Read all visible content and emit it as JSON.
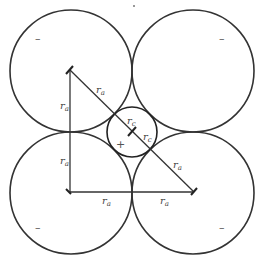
{
  "diagram": {
    "title": "",
    "stroke_color": "#333333",
    "large_circles": [
      {
        "id": "top-left",
        "cx": 71,
        "cy": 71,
        "r": 61,
        "sign": "–",
        "sign_x": 38,
        "sign_y": 41
      },
      {
        "id": "top-right",
        "cx": 193,
        "cy": 71,
        "r": 61,
        "sign": "–",
        "sign_x": 223,
        "sign_y": 41
      },
      {
        "id": "bottom-left",
        "cx": 71,
        "cy": 193,
        "r": 61,
        "sign": "–",
        "sign_x": 38,
        "sign_y": 230
      },
      {
        "id": "bottom-right",
        "cx": 193,
        "cy": 193,
        "r": 61,
        "sign": "–",
        "sign_x": 223,
        "sign_y": 230
      }
    ],
    "small_circle": {
      "id": "center",
      "cx": 132,
      "cy": 132,
      "r": 25,
      "sign": "+",
      "sign_x": 120,
      "sign_y": 148
    },
    "labels": {
      "ra_diag_top": {
        "main": "r",
        "sub": "a"
      },
      "ra_vert_top": {
        "main": "r",
        "sub": "a"
      },
      "ra_vert_bottom": {
        "main": "r",
        "sub": "a"
      },
      "ra_horiz_left": {
        "main": "r",
        "sub": "a"
      },
      "ra_horiz_right": {
        "main": "r",
        "sub": "a"
      },
      "ra_diag_bottom": {
        "main": "r",
        "sub": "a"
      },
      "rc_upper": {
        "main": "r",
        "sub": "c"
      },
      "rc_lower": {
        "main": "r",
        "sub": "c"
      }
    }
  }
}
